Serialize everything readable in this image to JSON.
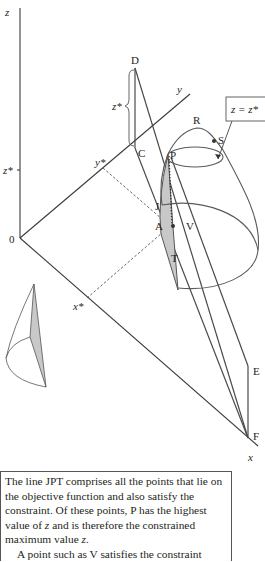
{
  "diagram": {
    "axes": {
      "z_label": "z",
      "y_label": "y",
      "x_label": "x",
      "origin_label": "0"
    },
    "ticks": {
      "z_star": "z*",
      "y_star": "y*",
      "x_star": "x*"
    },
    "brace_label": "z*",
    "points": {
      "D": "D",
      "C": "C",
      "R": "R",
      "S": "S",
      "P": "P",
      "J": "J",
      "A": "A",
      "V": "V",
      "T": "T",
      "E": "E",
      "F": "F"
    },
    "callout": {
      "text": "z = z*"
    },
    "colors": {
      "line": "#4a4a4a",
      "shaded_region": "#c8c8c8",
      "background": "#ffffff"
    }
  },
  "caption": {
    "paragraph1_pre": "The line JPT comprises all the points that lie on the objective function and also satisfy the constraint. Of these points, P has the highest value of ",
    "paragraph1_var1": "z",
    "paragraph1_mid": " and is therefore the constrained maximum value ",
    "paragraph1_var2": "z",
    "paragraph1_end": ".",
    "paragraph2": "A point such as V satisfies the constraint"
  }
}
